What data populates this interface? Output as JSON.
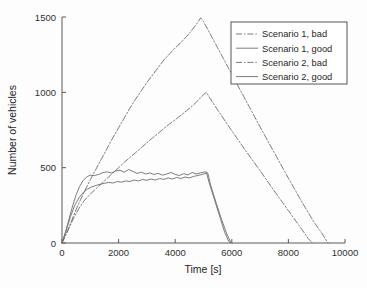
{
  "chart_data": {
    "type": "line",
    "title": "",
    "xlabel": "Time [s]",
    "ylabel": "Number of vehicles",
    "xlim": [
      0,
      10000
    ],
    "ylim": [
      0,
      1500
    ],
    "xticks": [
      0,
      2000,
      4000,
      6000,
      8000,
      10000
    ],
    "yticks": [
      0,
      500,
      1000,
      1500
    ],
    "xtick_labels": [
      "0",
      "2000",
      "4000",
      "6000",
      "8000",
      "10000"
    ],
    "ytick_labels": [
      "0",
      "500",
      "1000",
      "1500"
    ],
    "grid": false,
    "legend_position": "upper right",
    "series": [
      {
        "name": "Scenario 1, bad",
        "style": "dash-dot",
        "color": "#6e6e6e",
        "points": [
          [
            0,
            0
          ],
          [
            150,
            60
          ],
          [
            300,
            130
          ],
          [
            450,
            200
          ],
          [
            600,
            265
          ],
          [
            800,
            345
          ],
          [
            1000,
            420
          ],
          [
            1200,
            490
          ],
          [
            1400,
            560
          ],
          [
            1600,
            630
          ],
          [
            1800,
            700
          ],
          [
            2000,
            765
          ],
          [
            2200,
            830
          ],
          [
            2400,
            895
          ],
          [
            2600,
            955
          ],
          [
            2800,
            1010
          ],
          [
            3000,
            1065
          ],
          [
            3200,
            1115
          ],
          [
            3400,
            1165
          ],
          [
            3600,
            1215
          ],
          [
            3800,
            1255
          ],
          [
            4000,
            1295
          ],
          [
            4200,
            1330
          ],
          [
            4400,
            1370
          ],
          [
            4600,
            1415
          ],
          [
            4800,
            1465
          ],
          [
            4900,
            1495
          ],
          [
            5000,
            1470
          ],
          [
            5200,
            1400
          ],
          [
            5500,
            1295
          ],
          [
            6000,
            1120
          ],
          [
            6500,
            945
          ],
          [
            7000,
            770
          ],
          [
            7500,
            600
          ],
          [
            8000,
            430
          ],
          [
            8500,
            265
          ],
          [
            8900,
            140
          ],
          [
            9200,
            60
          ],
          [
            9400,
            0
          ]
        ]
      },
      {
        "name": "Scenario 1, good",
        "style": "solid",
        "color": "#6e6e6e",
        "points": [
          [
            0,
            0
          ],
          [
            120,
            70
          ],
          [
            250,
            160
          ],
          [
            380,
            250
          ],
          [
            500,
            320
          ],
          [
            620,
            375
          ],
          [
            750,
            415
          ],
          [
            880,
            440
          ],
          [
            1000,
            450
          ],
          [
            1150,
            448
          ],
          [
            1300,
            455
          ],
          [
            1450,
            468
          ],
          [
            1600,
            472
          ],
          [
            1750,
            465
          ],
          [
            1900,
            478
          ],
          [
            2050,
            482
          ],
          [
            2200,
            470
          ],
          [
            2350,
            488
          ],
          [
            2500,
            476
          ],
          [
            2650,
            462
          ],
          [
            2800,
            470
          ],
          [
            2950,
            458
          ],
          [
            3100,
            465
          ],
          [
            3250,
            455
          ],
          [
            3400,
            462
          ],
          [
            3550,
            450
          ],
          [
            3700,
            458
          ],
          [
            3850,
            468
          ],
          [
            4000,
            455
          ],
          [
            4150,
            448
          ],
          [
            4300,
            460
          ],
          [
            4450,
            452
          ],
          [
            4600,
            468
          ],
          [
            4750,
            458
          ],
          [
            4900,
            466
          ],
          [
            5000,
            470
          ],
          [
            5100,
            472
          ],
          [
            5200,
            400
          ],
          [
            5400,
            280
          ],
          [
            5600,
            160
          ],
          [
            5750,
            70
          ],
          [
            5870,
            20
          ],
          [
            5950,
            0
          ]
        ]
      },
      {
        "name": "Scenario 2, bad",
        "style": "dash-dot",
        "color": "#6e6e6e",
        "points": [
          [
            0,
            0
          ],
          [
            200,
            80
          ],
          [
            400,
            160
          ],
          [
            600,
            230
          ],
          [
            800,
            285
          ],
          [
            1000,
            325
          ],
          [
            1200,
            360
          ],
          [
            1400,
            395
          ],
          [
            1600,
            430
          ],
          [
            1800,
            465
          ],
          [
            2000,
            500
          ],
          [
            2200,
            535
          ],
          [
            2400,
            568
          ],
          [
            2600,
            600
          ],
          [
            2800,
            632
          ],
          [
            3000,
            665
          ],
          [
            3200,
            698
          ],
          [
            3400,
            728
          ],
          [
            3600,
            760
          ],
          [
            3800,
            790
          ],
          [
            4000,
            818
          ],
          [
            4200,
            848
          ],
          [
            4400,
            878
          ],
          [
            4600,
            908
          ],
          [
            4800,
            945
          ],
          [
            5000,
            985
          ],
          [
            5100,
            1000
          ],
          [
            5300,
            940
          ],
          [
            5600,
            855
          ],
          [
            6000,
            745
          ],
          [
            6500,
            610
          ],
          [
            7000,
            480
          ],
          [
            7500,
            345
          ],
          [
            8000,
            215
          ],
          [
            8400,
            110
          ],
          [
            8700,
            30
          ],
          [
            8850,
            0
          ]
        ]
      },
      {
        "name": "Scenario 2, good",
        "style": "solid",
        "color": "#6e6e6e",
        "points": [
          [
            0,
            0
          ],
          [
            150,
            85
          ],
          [
            300,
            175
          ],
          [
            450,
            250
          ],
          [
            600,
            300
          ],
          [
            750,
            335
          ],
          [
            900,
            358
          ],
          [
            1050,
            372
          ],
          [
            1200,
            382
          ],
          [
            1350,
            390
          ],
          [
            1500,
            396
          ],
          [
            1650,
            402
          ],
          [
            1800,
            398
          ],
          [
            1950,
            408
          ],
          [
            2100,
            404
          ],
          [
            2250,
            412
          ],
          [
            2400,
            408
          ],
          [
            2550,
            418
          ],
          [
            2700,
            412
          ],
          [
            2850,
            422
          ],
          [
            3000,
            416
          ],
          [
            3150,
            425
          ],
          [
            3300,
            418
          ],
          [
            3450,
            428
          ],
          [
            3600,
            422
          ],
          [
            3750,
            432
          ],
          [
            3900,
            425
          ],
          [
            4050,
            435
          ],
          [
            4200,
            428
          ],
          [
            4350,
            438
          ],
          [
            4500,
            432
          ],
          [
            4650,
            442
          ],
          [
            4800,
            448
          ],
          [
            4950,
            455
          ],
          [
            5080,
            462
          ],
          [
            5150,
            465
          ],
          [
            5250,
            385
          ],
          [
            5450,
            265
          ],
          [
            5650,
            150
          ],
          [
            5820,
            60
          ],
          [
            5950,
            10
          ],
          [
            6020,
            0
          ]
        ]
      }
    ]
  },
  "legend": {
    "entries": [
      {
        "label": "Scenario 1, bad"
      },
      {
        "label": "Scenario 1, good"
      },
      {
        "label": "Scenario 2, bad"
      },
      {
        "label": "Scenario 2, good"
      }
    ]
  }
}
